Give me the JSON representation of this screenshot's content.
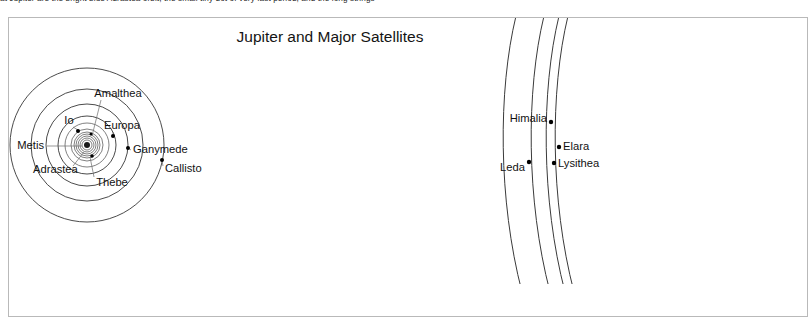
{
  "page": {
    "clipped_body_text": "at Jupiter are the bright blue Adrastea orbit,  the small tiny dot of very fast period, and the long strings"
  },
  "figure": {
    "title": "Jupiter and Major Satellites",
    "inner_moons": [
      {
        "name": "Metis",
        "label_x": 44,
        "label_y": 149,
        "anchor": "end",
        "dot_x": 88,
        "dot_y": 146,
        "leader": "M 47 146 L 82 146"
      },
      {
        "name": "Adrastea",
        "label_x": 33,
        "label_y": 172,
        "anchor": "start",
        "dot_x": 86,
        "dot_y": 150,
        "leader": "M 75 166 L 84 153"
      },
      {
        "name": "Amalthea",
        "label_x": 88,
        "label_y": 96,
        "anchor": "middle",
        "dot_x": 90,
        "dot_y": 138,
        "leader": "M 98 99 L 92 135"
      },
      {
        "name": "Thebe",
        "label_x": 98,
        "label_y": 183,
        "anchor": "middle",
        "dot_x": 93,
        "dot_y": 154,
        "leader": "M 93 176 L 91 157"
      },
      {
        "name": "Io",
        "label_x": 69,
        "label_y": 123,
        "anchor": "middle",
        "dot_x": 78,
        "dot_y": 131,
        "leader": "M 74 126 L 78 130"
      },
      {
        "name": "Europa",
        "label_x": 123,
        "label_y": 128,
        "anchor": "middle",
        "dot_x": 113,
        "dot_y": 136,
        "leader": "M 112 131 L 113 135"
      },
      {
        "name": "Ganymede",
        "label_x": 133,
        "label_y": 152,
        "anchor": "start",
        "dot_x": 128,
        "dot_y": 148,
        "leader": "M 130 149 L 127 148"
      },
      {
        "name": "Callisto",
        "label_x": 164,
        "label_y": 171,
        "anchor": "start",
        "dot_x": 162,
        "dot_y": 160,
        "leader": "M 163 166 L 162 161"
      }
    ],
    "outer_moons": [
      {
        "name": "Himalia",
        "label_x": 548,
        "label_y": 121,
        "anchor": "end",
        "dot_x": 551,
        "dot_y": 122
      },
      {
        "name": "Leda",
        "label_x": 525,
        "label_y": 171,
        "anchor": "end",
        "dot_x": 529,
        "dot_y": 162
      },
      {
        "name": "Elara",
        "label_x": 562,
        "label_y": 149,
        "anchor": "start",
        "dot_x": 559,
        "dot_y": 147
      },
      {
        "name": "Lysithea",
        "label_x": 558,
        "label_y": 166,
        "anchor": "start",
        "dot_x": 554,
        "dot_y": 163
      }
    ],
    "orbit_radii_px": [
      3,
      5,
      7,
      9,
      11,
      13,
      16,
      22,
      29,
      41,
      56,
      77
    ],
    "center": {
      "x": 87,
      "y": 145
    },
    "colors": {
      "frame": "#b9b9b9",
      "orbit": "#2b2b2b",
      "label": "#111111",
      "title": "#141414",
      "background": "#ffffff"
    }
  }
}
